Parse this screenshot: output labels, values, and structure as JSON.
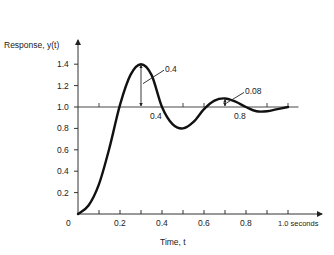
{
  "chart_data": {
    "type": "line",
    "title": "",
    "ylabel": "Response, y(t)",
    "xlabel": "Time, t",
    "x_unit_label": "1.0 seconds",
    "xlim": [
      0,
      1.0
    ],
    "ylim": [
      0,
      1.5
    ],
    "x_ticks": [
      0.1,
      0.2,
      0.3,
      0.4,
      0.5,
      0.6,
      0.7,
      0.8,
      0.9,
      1.0
    ],
    "x_tick_labels": [
      {
        "value": 0,
        "label": "0"
      },
      {
        "value": 0.2,
        "label": "0.2"
      },
      {
        "value": 0.4,
        "label": "0.4"
      },
      {
        "value": 0.6,
        "label": "0.6"
      },
      {
        "value": 0.8,
        "label": "0.8"
      },
      {
        "value": 1.0,
        "label": "1.0 seconds"
      }
    ],
    "y_ticks": [
      {
        "value": 0.2,
        "label": "0.2"
      },
      {
        "value": 0.4,
        "label": "0.4"
      },
      {
        "value": 0.6,
        "label": "0.6"
      },
      {
        "value": 0.8,
        "label": "0.8"
      },
      {
        "value": 1.0,
        "label": "1.0"
      },
      {
        "value": 1.2,
        "label": "1.2"
      },
      {
        "value": 1.4,
        "label": "1.4"
      }
    ],
    "reference_line": {
      "y": 1.0,
      "x_end": 1.05,
      "ticks": [
        0.1,
        0.5,
        0.6,
        0.9,
        1.0
      ]
    },
    "grid": false,
    "series": [
      {
        "name": "y(t)",
        "x": [
          0,
          0.05,
          0.1,
          0.15,
          0.2,
          0.25,
          0.3,
          0.35,
          0.4,
          0.45,
          0.5,
          0.55,
          0.6,
          0.65,
          0.7,
          0.75,
          0.8,
          0.85,
          0.9,
          0.95,
          1.0
        ],
        "y": [
          0,
          0.08,
          0.28,
          0.62,
          1.02,
          1.3,
          1.4,
          1.3,
          1.0,
          0.84,
          0.8,
          0.86,
          0.98,
          1.06,
          1.08,
          1.05,
          1.0,
          0.96,
          0.96,
          0.98,
          1.0
        ]
      }
    ],
    "annotations": [
      {
        "text": "0.4",
        "kind": "overshoot-amplitude",
        "at_x": 0.3,
        "from_y": 1.0,
        "to_y": 1.4
      },
      {
        "text": "0.4",
        "kind": "time-label",
        "at_x": 0.4,
        "y": 1.0
      },
      {
        "text": "0.08",
        "kind": "overshoot-amplitude",
        "at_x": 0.7,
        "from_y": 1.0,
        "to_y": 1.08
      },
      {
        "text": "0.8",
        "kind": "time-label",
        "at_x": 0.8,
        "y": 1.0
      }
    ]
  }
}
